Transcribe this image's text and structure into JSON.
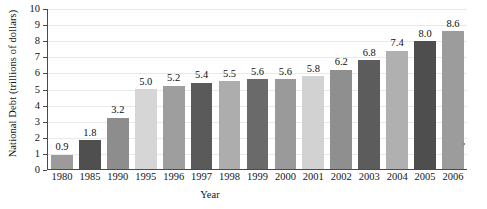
{
  "chart_data": {
    "type": "bar",
    "title": "",
    "subtitle": "",
    "xlabel": "Year",
    "ylabel": "National Debt (trillions of dollars)",
    "categories": [
      "1980",
      "1985",
      "1990",
      "1995",
      "1996",
      "1997",
      "1998",
      "1999",
      "2000",
      "2001",
      "2002",
      "2003",
      "2004",
      "2005",
      "2006"
    ],
    "values": [
      0.9,
      1.8,
      3.2,
      5.0,
      5.2,
      5.4,
      5.5,
      5.6,
      5.6,
      5.8,
      6.2,
      6.8,
      7.4,
      8.0,
      8.6
    ],
    "data_labels": [
      "0.9",
      "1.8",
      "3.2",
      "5.0",
      "5.2",
      "5.4",
      "5.5",
      "5.6",
      "5.6",
      "5.8",
      "6.2",
      "6.8",
      "7.4",
      "8.0",
      "8.6"
    ],
    "bar_colors": [
      "#9b9b9b",
      "#4f4f4f",
      "#8d8d8d",
      "#d6d6d6",
      "#9e9e9e",
      "#5a5a5a",
      "#adadad",
      "#6a6a6a",
      "#9a9a9a",
      "#d2d2d2",
      "#8f8f8f",
      "#5c5c5c",
      "#b0b0b0",
      "#4e4e4e",
      "#9c9c9c"
    ],
    "ylim": [
      0,
      10
    ],
    "ytick_labels": [
      "0",
      "1",
      "2",
      "3",
      "4",
      "5",
      "6",
      "7",
      "8",
      "9",
      "10"
    ],
    "ytick_values": [
      0,
      1,
      2,
      3,
      4,
      5,
      6,
      7,
      8,
      9,
      10
    ],
    "grid": true,
    "grid_color": "#e9e9e9",
    "axis_color": "#4a4a4a",
    "legend": null,
    "legend_position": "none",
    "annotations": []
  }
}
